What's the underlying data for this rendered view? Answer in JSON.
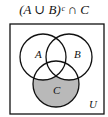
{
  "title": "(A ∪ B)ᶜ ∩ C",
  "diagram": {
    "type": "venn",
    "universe_label": "U",
    "sets": [
      {
        "label": "A",
        "cx": 43,
        "cy": 57,
        "r": 23
      },
      {
        "label": "B",
        "cx": 69,
        "cy": 57,
        "r": 23
      },
      {
        "label": "C",
        "cx": 56,
        "cy": 84,
        "r": 23
      }
    ],
    "shaded_region": "C minus (A union B)",
    "colors": {
      "shade": "#b9b9b9",
      "stroke": "#111111",
      "background": "#ffffff"
    }
  }
}
